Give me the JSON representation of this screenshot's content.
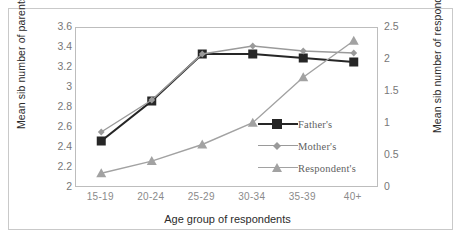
{
  "chart_data": {
    "type": "line",
    "title": "",
    "xlabel": "Age group of respondents",
    "ylabel": "Mean sib number of parents",
    "ylabel_secondary": "Mean sib number of respondent",
    "categories": [
      "15-19",
      "20-24",
      "25-29",
      "30-34",
      "35-39",
      "40+"
    ],
    "ylim": [
      2,
      3.6
    ],
    "yticks": [
      "3.6",
      "3.4",
      "3.2",
      "3",
      "2.8",
      "2.6",
      "2.4",
      "2.2",
      "2"
    ],
    "ylim_secondary": [
      0,
      2.5
    ],
    "yticks_secondary": [
      "2.5",
      "2",
      "1.5",
      "1",
      "0.5",
      "0"
    ],
    "grid": false,
    "legend_position": "inside-lower-right",
    "series": [
      {
        "name": "Father's",
        "axis": "left",
        "color": "#262626",
        "marker": "square",
        "values": [
          2.47,
          2.87,
          3.34,
          3.34,
          3.3,
          3.26
        ]
      },
      {
        "name": "Mother's",
        "axis": "left",
        "color": "#9a9a9a",
        "marker": "diamond",
        "values": [
          2.56,
          2.88,
          3.34,
          3.42,
          3.37,
          3.35
        ]
      },
      {
        "name": "Respondent's",
        "axis": "right",
        "color": "#a2a2a2",
        "marker": "triangle",
        "values": [
          0.23,
          0.42,
          0.68,
          1.02,
          1.73,
          2.3
        ]
      }
    ]
  },
  "colors": {
    "father": "#262626",
    "mother": "#9a9a9a",
    "respondent": "#a2a2a2",
    "axis": "#bdbdbd",
    "border": "#c9c9c9",
    "tick_text": "#7d7d7d",
    "title_text": "#2b2b2b"
  }
}
